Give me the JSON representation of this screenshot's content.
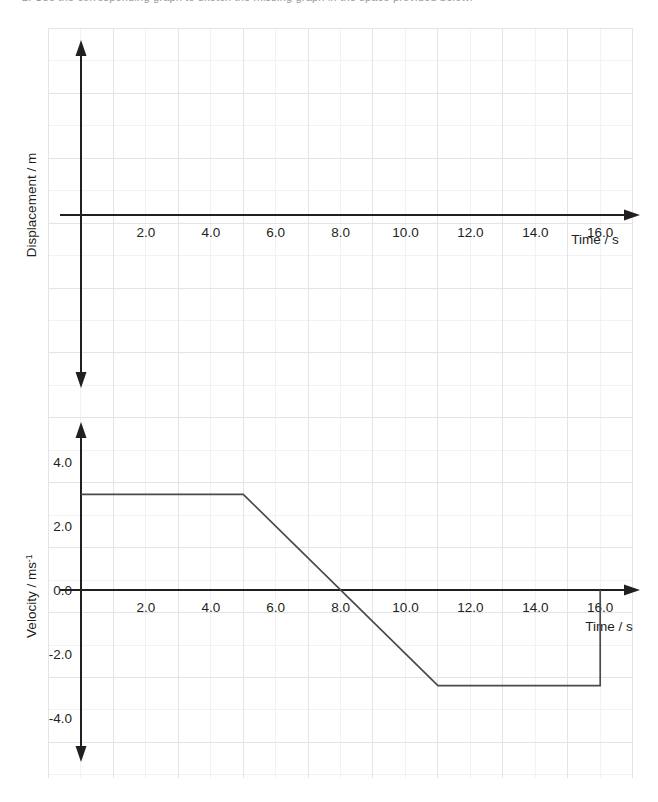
{
  "page": {
    "partial_top_line": "2. Use the corresponding graph to sketch the missing graph in the space provided below:",
    "background_color": "#ffffff",
    "ink_color": "#231f20",
    "grid_minor_color": "#f0eff2",
    "grid_major_color": "#e2e1e5",
    "curve_color": "#4a4a4a"
  },
  "grid": {
    "left": 48,
    "right": 632,
    "top": 28,
    "bottom": 778,
    "cell": 32.45,
    "major_every": 2
  },
  "chart_data": [
    {
      "id": "displacement-chart",
      "type": "line",
      "title": "",
      "xlabel": "Time / s",
      "ylabel": "Displacement / m",
      "x_ticks": [
        2.0,
        4.0,
        6.0,
        8.0,
        10.0,
        12.0,
        14.0,
        16.0
      ],
      "x_tick_labels": [
        "2.0",
        "4.0",
        "6.0",
        "8.0",
        "10.0",
        "12.0",
        "14.0",
        "16.0"
      ],
      "y_ticks": [],
      "y_tick_labels": [],
      "xlim": [
        0,
        17.5
      ],
      "ylim": [
        -5.4,
        5.4
      ],
      "grid": true,
      "legend": "none",
      "series": [
        {
          "name": "displacement",
          "x": [],
          "y": [],
          "note": "blank - to be sketched by student"
        }
      ]
    },
    {
      "id": "velocity-chart",
      "type": "line",
      "title": "",
      "xlabel": "Time / s",
      "ylabel": "Velocity / ms",
      "ylabel_superscript": "-1",
      "x_ticks": [
        2.0,
        4.0,
        6.0,
        8.0,
        10.0,
        12.0,
        14.0,
        16.0
      ],
      "x_tick_labels": [
        "2.0",
        "4.0",
        "6.0",
        "8.0",
        "10.0",
        "12.0",
        "14.0",
        "16.0"
      ],
      "y_ticks": [
        4.0,
        2.0,
        0.0,
        -2.0,
        -4.0
      ],
      "y_tick_labels": [
        "4.0",
        "2.0",
        "0.0",
        "-2.0",
        "-4.0"
      ],
      "xlim": [
        0,
        17.5
      ],
      "ylim": [
        -5.2,
        5.0
      ],
      "grid": true,
      "legend": "none",
      "series": [
        {
          "name": "velocity",
          "x": [
            0,
            5,
            11,
            16,
            16
          ],
          "y": [
            3,
            3,
            -3,
            -3,
            0
          ]
        }
      ]
    }
  ]
}
